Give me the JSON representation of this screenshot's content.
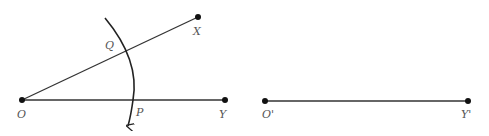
{
  "diagram": {
    "colors": {
      "line": "#333333",
      "point": "#111111",
      "label": "#555555",
      "background": "#ffffff"
    },
    "left_figure": {
      "points": [
        {
          "id": "O",
          "label": "O",
          "x": 22,
          "y": 100
        },
        {
          "id": "X",
          "label": "X",
          "x": 198,
          "y": 17
        },
        {
          "id": "Y",
          "label": "Y",
          "x": 225,
          "y": 100
        },
        {
          "id": "Q",
          "label": "Q",
          "x": 126,
          "y": 51
        },
        {
          "id": "P",
          "label": "P",
          "x": 133,
          "y": 100
        }
      ],
      "segments": [
        {
          "from": "O",
          "to": "X"
        },
        {
          "from": "O",
          "to": "Y"
        }
      ],
      "arc": {
        "center": "O",
        "through": [
          "Q",
          "P"
        ],
        "arrow_end": "bottom"
      }
    },
    "right_figure": {
      "points": [
        {
          "id": "O_prime",
          "label": "O'",
          "x": 265,
          "y": 100
        },
        {
          "id": "Y_prime",
          "label": "Y'",
          "x": 468,
          "y": 100
        }
      ],
      "segments": [
        {
          "from": "O'",
          "to": "Y'"
        }
      ]
    },
    "labels": {
      "O": "O",
      "X": "X",
      "Y": "Y",
      "Q": "Q",
      "P": "P",
      "O_prime": "O'",
      "Y_prime": "Y'"
    }
  }
}
